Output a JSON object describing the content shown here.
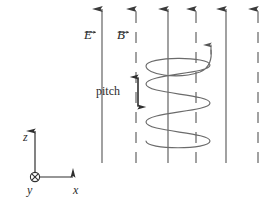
{
  "figure": {
    "background_color": "#ffffff",
    "line_color": "#4a4a4a",
    "helix_color": "#666666",
    "text_color": "#2b2b2b",
    "width": 280,
    "height": 204
  },
  "labels": {
    "electric_field": "E",
    "magnetic_field": "B",
    "pitch": "pitch",
    "axis_z": "z",
    "axis_y": "y",
    "axis_x": "x"
  },
  "field_lines": {
    "count": 6,
    "direction": "up",
    "top_y": 8,
    "bottom_y": 163,
    "items": [
      {
        "x": 102,
        "style": "solid",
        "field": "E"
      },
      {
        "x": 136,
        "style": "dashed",
        "field": "B"
      },
      {
        "x": 168,
        "style": "solid",
        "field": "E"
      },
      {
        "x": 196,
        "style": "dashed",
        "field": "B"
      },
      {
        "x": 226,
        "style": "solid",
        "field": "E"
      },
      {
        "x": 258,
        "style": "dashed",
        "field": "B"
      }
    ]
  },
  "helix": {
    "turns": 2,
    "center_x": 178,
    "radius_x": 34,
    "radius_y": 14,
    "top_y": 62,
    "bottom_y": 148,
    "arrow_tip": {
      "x": 211,
      "y": 41
    },
    "direction": "counterclockwise-upward"
  },
  "pitch_dimension": {
    "x": 138,
    "top_y": 72,
    "bottom_y": 112,
    "arrowheads": "both"
  },
  "axes": {
    "origin": {
      "x": 35,
      "y": 177
    },
    "z_tip": {
      "x": 35,
      "y": 126
    },
    "x_tip": {
      "x": 78,
      "y": 177
    },
    "y_symbol": "into-page"
  }
}
